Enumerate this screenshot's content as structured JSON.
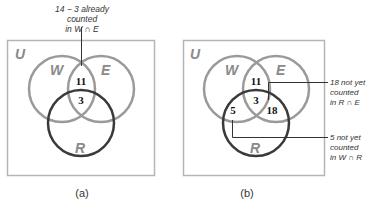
{
  "colors": {
    "frame": "#b5b5b5",
    "circle_w_e": "#999999",
    "circle_r": "#3a3a3a",
    "set_label": "#8a8a8a"
  },
  "panels": [
    {
      "caption": "(a)",
      "universe_label": "U",
      "sets": {
        "W": "W",
        "E": "E",
        "R": "R"
      },
      "regions": {
        "w_and_e_only": "11",
        "w_e_r": "3"
      },
      "annotations": [
        {
          "line1": "14 − 3 already counted",
          "line2": "in W ∩ E"
        }
      ]
    },
    {
      "caption": "(b)",
      "universe_label": "U",
      "sets": {
        "W": "W",
        "E": "E",
        "R": "R"
      },
      "regions": {
        "w_and_e_only": "11",
        "w_e_r": "3",
        "r_and_e_only": "18",
        "w_and_r_only": "5"
      },
      "annotations": [
        {
          "line1": "18 not yet",
          "line2": "counted",
          "line3": "in R ∩ E"
        },
        {
          "line1": "5 not yet",
          "line2": "counted",
          "line3": "in W ∩ R"
        }
      ]
    }
  ]
}
